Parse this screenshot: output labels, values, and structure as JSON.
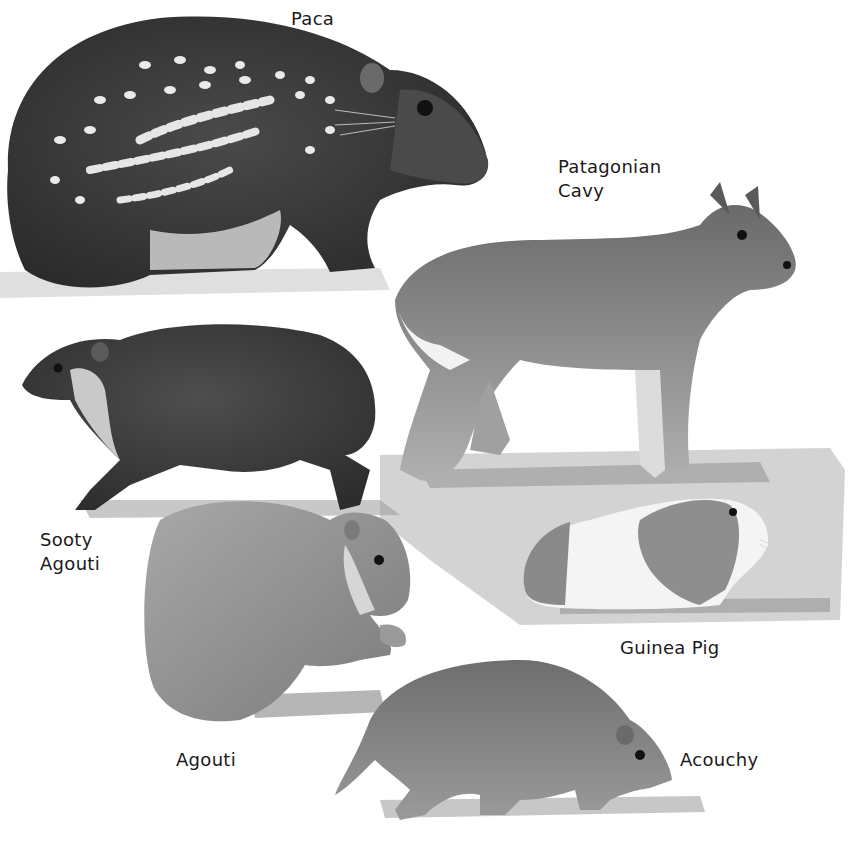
{
  "plate": {
    "description": "Illustration plate of cavy-like rodents",
    "animals": [
      {
        "id": "paca",
        "label": "Paca"
      },
      {
        "id": "patagonian-cavy",
        "label_line1": "Patagonian",
        "label_line2": "Cavy"
      },
      {
        "id": "sooty-agouti",
        "label_line1": "Sooty",
        "label_line2": "Agouti"
      },
      {
        "id": "guinea-pig",
        "label": "Guinea Pig"
      },
      {
        "id": "agouti",
        "label": "Agouti"
      },
      {
        "id": "acouchy",
        "label": "Acouchy"
      }
    ]
  },
  "colors": {
    "background": "#ffffff",
    "text": "#1a1a1a",
    "dark_fur": "#3a3a3a",
    "mid_fur": "#7a7a7a",
    "light_fur": "#bdbdbd",
    "ground_shadow": "#b5b5b5"
  }
}
